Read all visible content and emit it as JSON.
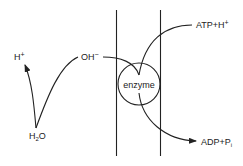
{
  "diagram": {
    "type": "membrane ATPase proton pump schematic",
    "membrane": {
      "label": ""
    },
    "enzyme": {
      "label": "enzyme"
    },
    "labels": {
      "h_plus_left": {
        "base": "H",
        "sup": "+"
      },
      "water": {
        "base": "H",
        "sub": "2",
        "tail": "O"
      },
      "hydroxide": {
        "base": "OH",
        "sup": "−"
      },
      "atp": {
        "text": "ATP+H",
        "sup": "+"
      },
      "adp": {
        "text": "ADP+P",
        "sub": "i"
      }
    },
    "arrows": [
      {
        "from": "H2O",
        "to": "H+",
        "arrowhead": true
      },
      {
        "from": "H2O",
        "to": "OH−",
        "arrowhead": false
      },
      {
        "from": "OH−",
        "to": "enzyme",
        "arrowhead": false
      },
      {
        "from": "ATP+H+",
        "to": "enzyme",
        "arrowhead": false
      },
      {
        "from": "enzyme",
        "to": "ADP+Pi",
        "arrowhead": true
      }
    ],
    "colors": {
      "ink": "#222222",
      "background": "#ffffff"
    }
  }
}
